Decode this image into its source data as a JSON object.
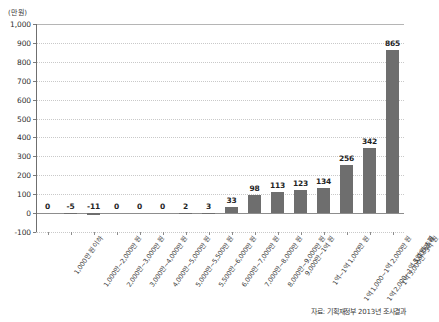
{
  "unit_label": "(만 원)",
  "source_note": "자료: 기획재정부 2013년 조사결과",
  "chart_data": {
    "type": "bar",
    "title": "",
    "xlabel": "",
    "ylabel": "(만 원)",
    "ylim": [
      -100,
      1000
    ],
    "ytick_step": 100,
    "yticks": [
      "1,000",
      "900",
      "800",
      "700",
      "600",
      "500",
      "400",
      "300",
      "200",
      "100",
      "0",
      "-100"
    ],
    "ytick_values": [
      1000,
      900,
      800,
      700,
      600,
      500,
      400,
      300,
      200,
      100,
      0,
      -100
    ],
    "grid": true,
    "legend": "none",
    "bar_color": "#6e6e6e",
    "categories": [
      "1,000만 원 이하",
      "1,000만~2,000만 원",
      "2,000만~3,000만 원",
      "3,000만~4,000만 원",
      "4,000만~5,000만 원",
      "5,000만~5,500만 원",
      "5,500만~6,000만 원",
      "6,000만~7,000만 원",
      "7,000만~8,000만 원",
      "8,000만~9,000만 원",
      "9,000만~1억 원",
      "1억~1억 1,000만 원",
      "1억 1,000~1억 2,000만 원",
      "1억 2,000~1억 5,000만 원",
      "1억 5,000만~3억 원",
      "3억 원 초과"
    ],
    "values": [
      0,
      -5,
      -11,
      0,
      0,
      0,
      2,
      3,
      33,
      98,
      113,
      123,
      134,
      256,
      342,
      865
    ],
    "value_labels": [
      "0",
      "-5",
      "-11",
      "0",
      "0",
      "0",
      "2",
      "3",
      "33",
      "98",
      "113",
      "123",
      "134",
      "256",
      "342",
      "865"
    ]
  }
}
